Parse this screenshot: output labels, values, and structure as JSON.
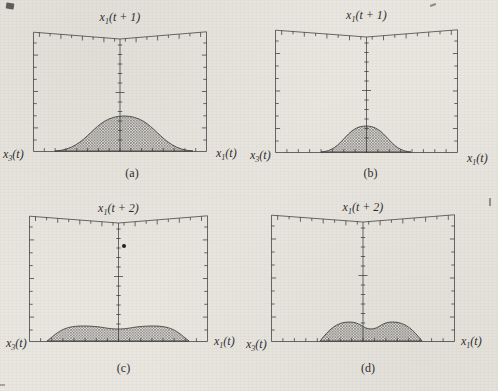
{
  "figure": {
    "background": "#e9e6e0",
    "line_color": "#3a3a3a",
    "mesh_color": "#424242",
    "text_color": "#2b2b2b",
    "artifacts": [
      "ink-smudge-top-left",
      "faint-mark-top-right",
      "faint-mark-right-edge",
      "faint-mark-bottom-left"
    ]
  },
  "axes_style": {
    "top_dip_px": 8,
    "top_ticks_per_side": 8,
    "side_ticks": 9,
    "bottom_ticks": 16,
    "center_tick_spacing_px": 9.5,
    "tick_labels": "none"
  },
  "panels": [
    {
      "id": "a",
      "caption": "(a)",
      "title_parts": {
        "base": "x",
        "sub": "1",
        "rest": "(t + 1)"
      },
      "left_parts": {
        "base": "x",
        "sub": "3",
        "rest": "(t)"
      },
      "right_parts": {
        "base": "x",
        "sub": "1",
        "rest": "(t)"
      }
    },
    {
      "id": "b",
      "caption": "(b)",
      "title_parts": {
        "base": "x",
        "sub": "1",
        "rest": "(t + 1)"
      },
      "left_parts": {
        "base": "x",
        "sub": "3",
        "rest": "(t)"
      },
      "right_parts": {
        "base": "x",
        "sub": "1",
        "rest": "(t)"
      }
    },
    {
      "id": "c",
      "caption": "(c)",
      "title_parts": {
        "base": "x",
        "sub": "1",
        "rest": "(t + 2)"
      },
      "left_parts": {
        "base": "x",
        "sub": "3",
        "rest": "(t)"
      },
      "right_parts": {
        "base": "x",
        "sub": "1",
        "rest": "(t)"
      }
    },
    {
      "id": "d",
      "caption": "(d)",
      "title_parts": {
        "base": "x",
        "sub": "1",
        "rest": "(t + 2)"
      },
      "left_parts": {
        "base": "x",
        "sub": "3",
        "rest": "(t)"
      },
      "right_parts": {
        "base": "x",
        "sub": "1",
        "rest": "(t)"
      }
    }
  ],
  "chart_data": [
    {
      "panel": "a",
      "type": "area",
      "subtype": "3d-wireframe-mesh-surface",
      "title": "x1(t + 1)",
      "axis_left": "x3(t)",
      "axis_right": "x1(t)",
      "caption": "(a)",
      "axis_tick_labels": "none (unlabeled tick marks only)",
      "surface": {
        "shape": "bell",
        "description": "broad bell-shaped density mesh centered on vertical axis, base spans ~79% of box width, peak ~29% of box height",
        "cx": 91,
        "half_width": 69,
        "height": 35,
        "dip": 0
      },
      "stray_point": null
    },
    {
      "panel": "b",
      "type": "area",
      "subtype": "3d-wireframe-mesh-surface",
      "title": "x1(t + 1)",
      "axis_left": "x3(t)",
      "axis_right": "x1(t)",
      "caption": "(b)",
      "axis_tick_labels": "none (unlabeled tick marks only)",
      "surface": {
        "shape": "bell",
        "description": "narrower bell-shaped density mesh centered on vertical axis, base spans ~49% of box width, peak ~21% of box height",
        "cx": 91,
        "half_width": 45,
        "height": 26,
        "dip": 0
      },
      "stray_point": null
    },
    {
      "panel": "c",
      "type": "area",
      "subtype": "3d-wireframe-mesh-surface",
      "title": "x1(t + 2)",
      "axis_left": "x3(t)",
      "axis_right": "x1(t)",
      "caption": "(c)",
      "axis_tick_labels": "none (unlabeled tick marks only)",
      "surface": {
        "shape": "plateau",
        "description": "wide flat low plateau mesh with slight central depression, base spans ~79% of box width, height ~12% of box height",
        "cx": 89,
        "half_width": 71,
        "height": 15,
        "dip": 3
      },
      "stray_point": {
        "x": 95,
        "y": 31,
        "r": 2,
        "note": "small solid dot just right of vertical axis, upper-middle of box"
      }
    },
    {
      "panel": "d",
      "type": "area",
      "subtype": "3d-wireframe-mesh-surface",
      "title": "x1(t + 2)",
      "axis_left": "x3(t)",
      "axis_right": "x1(t)",
      "caption": "(d)",
      "axis_tick_labels": "none (unlabeled tick marks only)",
      "surface": {
        "shape": "bimodal",
        "description": "two-lobed mesh mound with central dip, slightly right of vertical axis, base spans ~55% of box width, height ~15% of box height",
        "cx": 100,
        "half_width": 51,
        "height": 19,
        "dip": 7
      },
      "stray_point": null
    }
  ]
}
